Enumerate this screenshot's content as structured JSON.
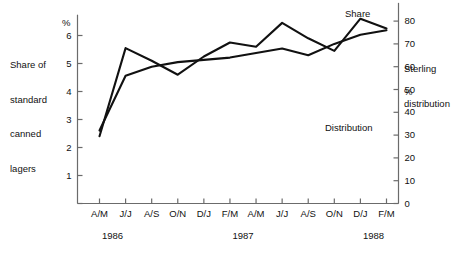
{
  "figure": {
    "left_caption_lines": [
      "Share of",
      "standard",
      "canned",
      "lagers"
    ],
    "left_axis_unit": "%",
    "right_axis_unit": "%",
    "series_labels": {
      "share": "Share",
      "distribution": "Distribution",
      "sterling_lines": [
        "Sterling",
        "distribution"
      ]
    },
    "year_labels": [
      "1986",
      "1987",
      "1988"
    ],
    "line_color": "#111111",
    "axis_color": "#6b6b6b"
  },
  "chart_data": {
    "type": "line",
    "title": "",
    "xlabel": "",
    "ylabel": "Share of standard canned lagers",
    "grid": false,
    "legend_position": "inline-annotations",
    "categories": [
      "A/M",
      "J/J",
      "A/S",
      "O/N",
      "D/J",
      "F/M",
      "A/M",
      "J/J",
      "A/S",
      "O/N",
      "D/J",
      "F/M"
    ],
    "year_groups": [
      {
        "year": "1986",
        "from_index": 0,
        "to_index": 1
      },
      {
        "year": "1987",
        "from_index": 2,
        "to_index": 9
      },
      {
        "year": "1988",
        "from_index": 10,
        "to_index": 11
      }
    ],
    "axes": {
      "left": {
        "label": "%",
        "ticks": [
          0,
          1,
          2,
          3,
          4,
          5,
          6
        ],
        "tick_labels": [
          "",
          "1",
          "2",
          "3",
          "4",
          "5",
          "6"
        ],
        "range": [
          0,
          6.6
        ]
      },
      "right": {
        "label": "%",
        "ticks": [
          0,
          10,
          20,
          30,
          40,
          50,
          60,
          70,
          80
        ],
        "tick_labels": [
          "0",
          "10",
          "20",
          "30",
          "40",
          "50",
          "60",
          "70",
          "80"
        ],
        "range": [
          0,
          88
        ]
      }
    },
    "series": [
      {
        "name": "Share",
        "axis": "left",
        "unit": "%",
        "values": [
          2.4,
          5.55,
          5.1,
          4.6,
          5.25,
          5.75,
          5.6,
          6.45,
          5.9,
          5.45,
          6.6,
          6.25
        ]
      },
      {
        "name": "Distribution",
        "axis": "right",
        "unit": "%",
        "values": [
          32,
          56,
          60,
          62,
          63,
          64,
          66,
          68,
          65,
          70,
          74,
          76
        ]
      }
    ]
  }
}
